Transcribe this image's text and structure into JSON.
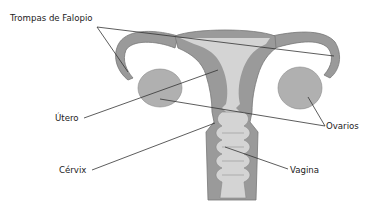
{
  "diagram": {
    "colors": {
      "tissue": "#9a9a9a",
      "tissue_outline": "#777777",
      "cavity": "#d4d4d4",
      "ovary": "#b0b0b0",
      "leader_line": "#333333",
      "text": "#222222",
      "background": "#ffffff"
    },
    "labels": [
      {
        "id": "trompas",
        "text": "Trompas de Falopio"
      },
      {
        "id": "utero",
        "text": "Útero"
      },
      {
        "id": "ovarios",
        "text": "Ovarios"
      },
      {
        "id": "cervix",
        "text": "Cérvix"
      },
      {
        "id": "vagina",
        "text": "Vagina"
      }
    ]
  }
}
